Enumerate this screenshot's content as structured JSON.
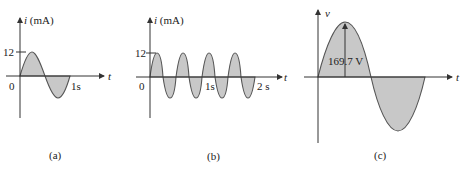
{
  "panels": [
    {
      "id": "a",
      "caption": "(a)",
      "y_axis_label": "i (mA)",
      "y_axis_var": "i",
      "y_axis_unit": "(mA)",
      "x_axis_label": "t",
      "origin_label": "0",
      "peak_label": "12",
      "time_label": "1s",
      "cycles": 1,
      "period_s": 1
    },
    {
      "id": "b",
      "caption": "(b)",
      "y_axis_label": "i (mA)",
      "y_axis_var": "i",
      "y_axis_unit": "(mA)",
      "x_axis_label": "t",
      "origin_label": "0",
      "peak_label": "12",
      "time_label_1": "1s",
      "time_label_2": "2 s",
      "cycles": 4,
      "period_s": 0.5
    },
    {
      "id": "c",
      "caption": "(c)",
      "y_axis_label": "v",
      "x_axis_label": "t",
      "peak_annotation": "169.7 V",
      "cycles": 1
    }
  ],
  "colors": {
    "fill": "#c8c8c8",
    "stroke": "#555555",
    "axis": "#333333",
    "text": "#222222"
  }
}
